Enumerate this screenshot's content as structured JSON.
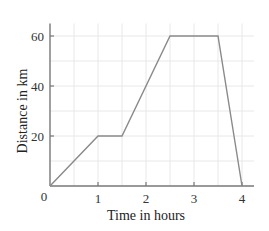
{
  "chart_data": {
    "type": "line",
    "title": "",
    "xlabel": "Time in hours",
    "ylabel": "Distance in km",
    "x": [
      0,
      1,
      1.5,
      2.5,
      3.5,
      4
    ],
    "series": [
      {
        "name": "Distance",
        "values": [
          0,
          20,
          20,
          60,
          60,
          0
        ]
      }
    ],
    "xlim": [
      0,
      4.25
    ],
    "ylim": [
      0,
      65
    ],
    "xticks": [
      0,
      1,
      2,
      3,
      4
    ],
    "yticks": [
      0,
      20,
      40,
      60
    ],
    "xtick_labels": [
      "0",
      "1",
      "2",
      "3",
      "4"
    ],
    "ytick_labels": [
      "20",
      "40",
      "60"
    ],
    "origin_label": "0",
    "grid": true,
    "grid_x_step": 0.5,
    "grid_y_step": 10,
    "legend": null,
    "colors": {
      "line": "#8a8a8a",
      "axis": "#777777",
      "grid": "#e8e8e8"
    }
  }
}
